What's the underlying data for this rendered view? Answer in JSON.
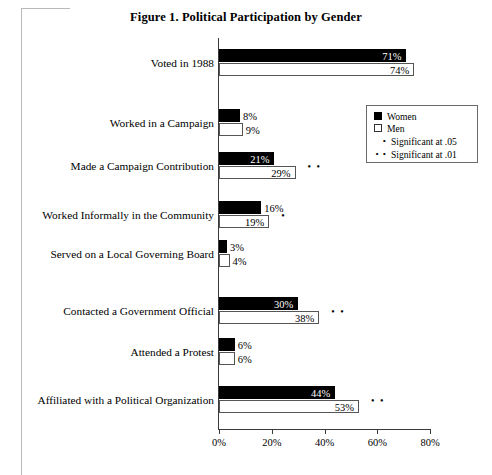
{
  "chart_data": {
    "type": "bar",
    "orientation": "horizontal",
    "title": "Figure 1. Political Participation by Gender",
    "xlabel": "",
    "ylabel": "",
    "xlim": [
      0,
      80
    ],
    "xticks": [
      0,
      20,
      40,
      60,
      80
    ],
    "xtick_labels": [
      "0%",
      "20%",
      "40%",
      "60%",
      "80%"
    ],
    "grid": false,
    "legend_position": "upper-right-inset",
    "value_suffix": "%",
    "categories": [
      "Voted in 1988",
      "Worked in a Campaign",
      "Made a Campaign Contribution",
      "Worked Informally in the Community",
      "Served on a Local Governing Board",
      "Contacted a Government Official",
      "Attended a Protest",
      "Affiliated with a Political Organization"
    ],
    "series": [
      {
        "name": "Women",
        "color": "#000000",
        "values": [
          71,
          8,
          21,
          16,
          3,
          30,
          6,
          44
        ],
        "value_labels": [
          "71%",
          "8%",
          "21%",
          "16%",
          "3%",
          "30%",
          "6%",
          "44%"
        ]
      },
      {
        "name": "Men",
        "color": "#ffffff",
        "values": [
          74,
          9,
          29,
          19,
          4,
          38,
          6,
          53
        ],
        "value_labels": [
          "74%",
          "9%",
          "29%",
          "19%",
          "4%",
          "38%",
          "6%",
          "53%"
        ]
      }
    ],
    "significance": [
      "",
      "",
      "• •",
      "•",
      "",
      "• •",
      "",
      "• •"
    ],
    "annotations": {
      "sig_05_symbol": "•",
      "sig_01_symbol": "• •"
    }
  },
  "legend": {
    "entries": [
      {
        "label": "Women",
        "swatch": "filled-square"
      },
      {
        "label": "Men",
        "swatch": "open-square"
      }
    ],
    "notes": [
      {
        "dots": "•",
        "label": "Significant at .05"
      },
      {
        "dots": "• •",
        "label": "Significant at .01"
      }
    ]
  }
}
